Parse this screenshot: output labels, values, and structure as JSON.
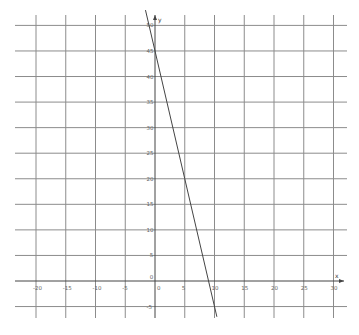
{
  "chart_data": {
    "type": "line",
    "title": "",
    "xlabel": "x",
    "ylabel": "y",
    "xlim": [
      -23,
      32
    ],
    "ylim": [
      -7,
      53
    ],
    "grid": true,
    "x_ticks": [
      -20,
      -15,
      -10,
      -5,
      0,
      5,
      10,
      15,
      20,
      25,
      30
    ],
    "x_tick_labels": [
      "-20",
      "-15",
      "-10",
      "-5",
      "0",
      "5",
      "10",
      "15",
      "20",
      "25",
      "30"
    ],
    "y_ticks": [
      -5,
      0,
      5,
      10,
      15,
      20,
      25,
      30,
      35,
      40,
      45,
      50
    ],
    "y_tick_labels": [
      "-5",
      "0",
      "5",
      "10",
      "15",
      "20",
      "25",
      "30",
      "35",
      "40",
      "45",
      "50"
    ],
    "series": [
      {
        "name": "y = 45 - 5x",
        "equation": "y = -5x + 45",
        "x": [
          -1.6,
          0,
          5,
          9,
          10.4
        ],
        "values": [
          53,
          45,
          20,
          0,
          -7
        ]
      }
    ],
    "legend": null
  },
  "labels": {
    "x_axis": "x",
    "y_axis": "y"
  }
}
